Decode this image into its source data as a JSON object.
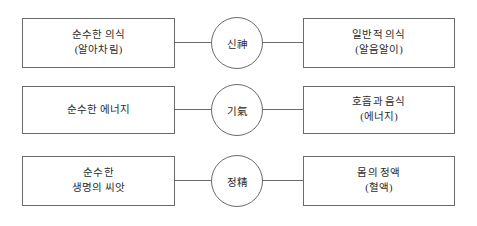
{
  "diagram": {
    "type": "three-column-relationship-diagram",
    "background_color": "#ffffff",
    "stroke_color": "#6b6b6b",
    "text_color": "#2b2b2b",
    "rows": [
      {
        "id": "row-sin",
        "left_box": {
          "lines": [
            "순수한 의식",
            "(알아차림)"
          ]
        },
        "circle": {
          "label": "신神"
        },
        "right_box": {
          "lines": [
            "일반적 의식",
            "(알음알이)"
          ]
        }
      },
      {
        "id": "row-gi",
        "left_box": {
          "lines": [
            "순수한 에너지"
          ]
        },
        "circle": {
          "label": "기氣"
        },
        "right_box": {
          "lines": [
            "호흡과 음식",
            "(에너지)"
          ]
        }
      },
      {
        "id": "row-jeong",
        "left_box": {
          "lines": [
            "순수한",
            "생명의 씨앗"
          ]
        },
        "circle": {
          "label": "정精"
        },
        "right_box": {
          "lines": [
            "몸의 정액",
            "(혈액)"
          ]
        }
      }
    ]
  }
}
